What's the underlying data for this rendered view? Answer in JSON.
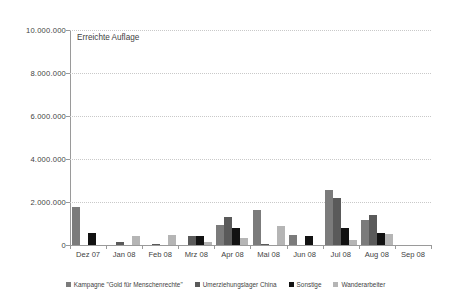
{
  "chart_data": {
    "type": "bar",
    "title": "Erreichte Auflage",
    "xlabel": "",
    "ylabel": "",
    "grid": true,
    "legend_position": "bottom",
    "ylim": [
      0,
      10000000
    ],
    "yticks": [
      0,
      2000000,
      4000000,
      6000000,
      8000000,
      10000000
    ],
    "ytick_labels": [
      "0",
      "2.000.000",
      "4.000.000",
      "6.000.000",
      "8.000.000",
      "10.000.000"
    ],
    "categories": [
      "Dez 07",
      "Jan 08",
      "Feb 08",
      "Mrz 08",
      "Apr 08",
      "Mai 08",
      "Jun 08",
      "Jul 08",
      "Aug 08",
      "Sep 08"
    ],
    "series": [
      {
        "name": "Kampagne \"Gold für Menschenrechte\"",
        "color": "#7b7b7b",
        "values": [
          1750000,
          0,
          0,
          0,
          950000,
          1650000,
          450000,
          2550000,
          1150000,
          0
        ]
      },
      {
        "name": "Umerziehungslager China",
        "color": "#5a5a5a",
        "values": [
          0,
          130000,
          55000,
          400000,
          1300000,
          60000,
          0,
          2200000,
          1400000,
          0
        ]
      },
      {
        "name": "Sonstige",
        "color": "#121212",
        "values": [
          560000,
          0,
          0,
          420000,
          800000,
          0,
          420000,
          800000,
          560000,
          0
        ]
      },
      {
        "name": "Wanderarbeiter",
        "color": "#b5b5b5",
        "values": [
          0,
          420000,
          480000,
          130000,
          330000,
          900000,
          0,
          250000,
          520000,
          0
        ]
      }
    ]
  }
}
